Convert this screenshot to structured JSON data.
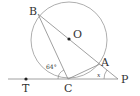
{
  "diagram": {
    "points": {
      "B": "B",
      "O": "O",
      "A": "A",
      "P": "P",
      "C": "C",
      "T": "T"
    },
    "angles": {
      "angle_BCT": "64°",
      "angle_P": "x"
    },
    "colors": {
      "stroke": "#888888",
      "text": "#333333"
    }
  }
}
